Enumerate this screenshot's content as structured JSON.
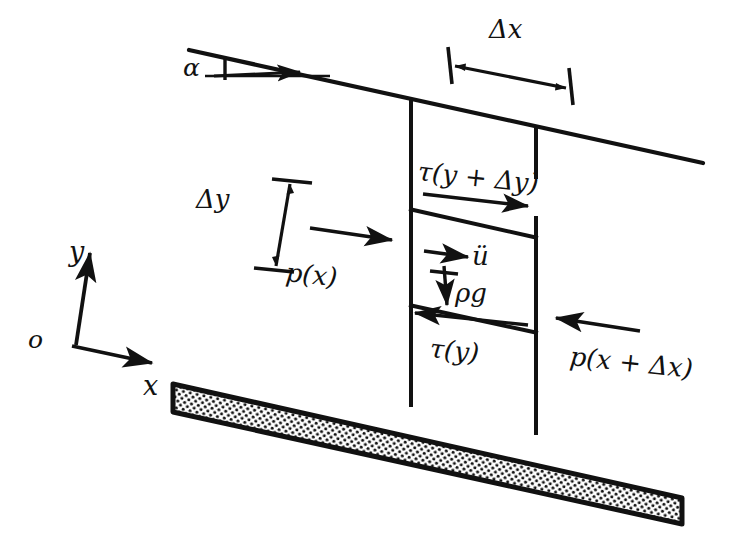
{
  "figure": {
    "kind": "free-body-diagram",
    "bg_color": "#ffffff",
    "ink_color": "#111111"
  },
  "axes": {
    "origin_label": "o",
    "y_label": "y",
    "x_label": "x"
  },
  "slope": {
    "angle_label": "α"
  },
  "dimensions": {
    "dx_label": "Δx",
    "dy_label": "Δy"
  },
  "forces": {
    "shear_top_label": "τ(y + Δy)",
    "shear_bottom_label": "τ(y)",
    "pressure_left_label": "p(x)",
    "pressure_right_label": "p(x + Δx)",
    "gravity_label": "ρg",
    "acceleration_label": "ü"
  }
}
